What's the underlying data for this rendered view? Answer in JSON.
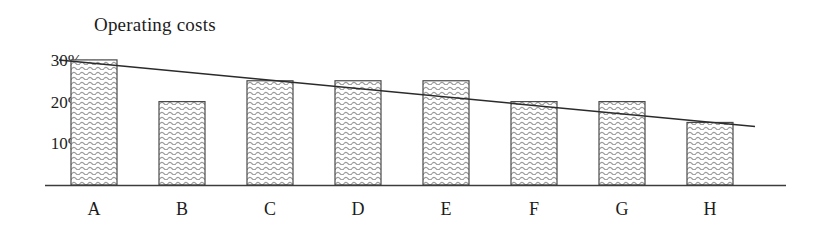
{
  "chart_data": {
    "type": "bar",
    "title": "Operating costs",
    "xlabel": "",
    "ylabel": "",
    "categories": [
      "A",
      "B",
      "C",
      "D",
      "E",
      "F",
      "G",
      "H"
    ],
    "values": [
      30,
      20,
      25,
      25,
      25,
      20,
      20,
      15
    ],
    "value_unit": "%",
    "ylim": [
      0,
      32
    ],
    "ytick_values": [
      30,
      20,
      10
    ],
    "ytick_labels": [
      "30%",
      "20%",
      "10%"
    ],
    "grid": false,
    "legend": null,
    "series": [
      {
        "name": "Operating costs",
        "type": "bar",
        "values": [
          30,
          20,
          25,
          25,
          25,
          20,
          20,
          15
        ]
      },
      {
        "name": "trend-line",
        "type": "line",
        "start_value": 30,
        "end_value": 14,
        "values": [
          30,
          28,
          25.9,
          23.8,
          21.7,
          19.6,
          17.5,
          15.4
        ]
      }
    ],
    "style": {
      "bar_fill": "#ffffff",
      "bar_hatch": "wavy-horizontal",
      "bar_hatch_color": "#9a9a9a",
      "bar_border_color": "#4a4a4a",
      "axis_color": "#3c3c3c",
      "trendline_color": "#2b2b2b",
      "text_color": "#1c1c1c",
      "background": "#ffffff"
    }
  }
}
